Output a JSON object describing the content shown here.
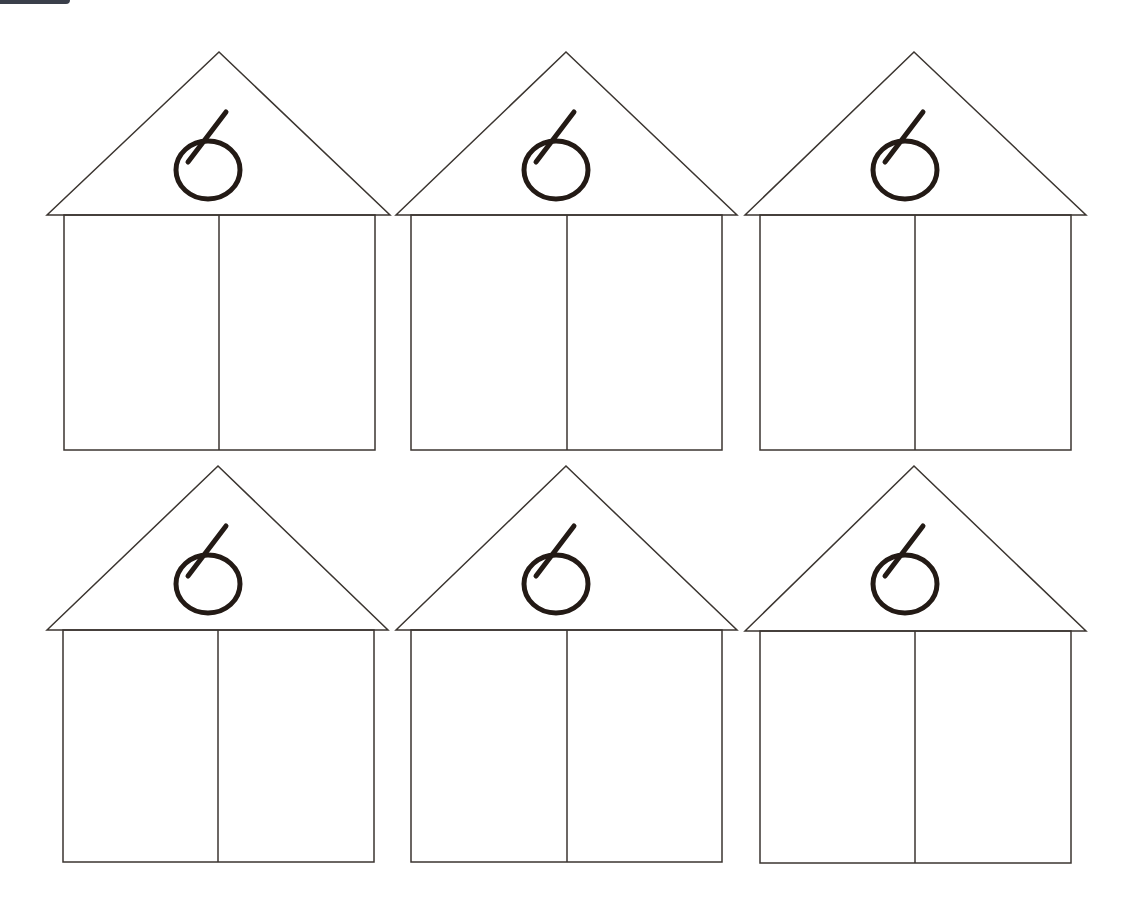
{
  "worksheet": {
    "title": "",
    "colors": {
      "line": "#3b3530",
      "number": "#231a15",
      "background": "#ffffff"
    },
    "houses": [
      {
        "row": 1,
        "col": 1,
        "roof_number": "6",
        "left_box": "",
        "right_box": ""
      },
      {
        "row": 1,
        "col": 2,
        "roof_number": "6",
        "left_box": "",
        "right_box": ""
      },
      {
        "row": 1,
        "col": 3,
        "roof_number": "6",
        "left_box": "",
        "right_box": ""
      },
      {
        "row": 2,
        "col": 1,
        "roof_number": "6",
        "left_box": "",
        "right_box": ""
      },
      {
        "row": 2,
        "col": 2,
        "roof_number": "6",
        "left_box": "",
        "right_box": ""
      },
      {
        "row": 2,
        "col": 3,
        "roof_number": "6",
        "left_box": "",
        "right_box": ""
      }
    ]
  }
}
